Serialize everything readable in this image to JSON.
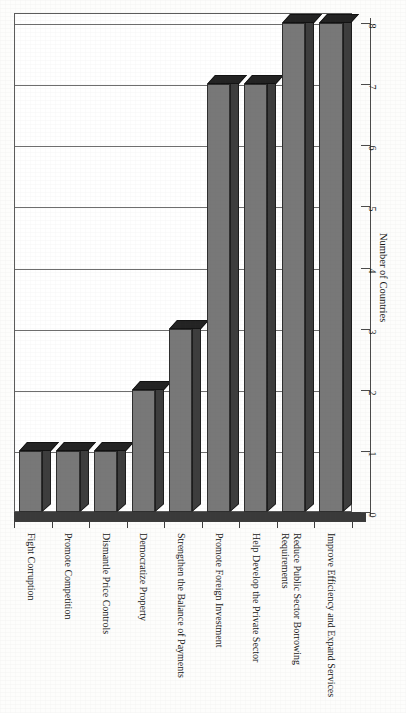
{
  "chart_data": {
    "type": "bar",
    "title": "",
    "subtitle": "",
    "orientation": "vertical-bars-rotated-page",
    "xlabel": "",
    "ylabel": "Number of Countries",
    "ylim": [
      0,
      8
    ],
    "ytick_labels": [
      "0",
      "1",
      "2",
      "3",
      "4",
      "5",
      "6",
      "7",
      "8"
    ],
    "ytick_values": [
      0,
      1,
      2,
      3,
      4,
      5,
      6,
      7,
      8
    ],
    "grid": "horizontal-gridlines-on",
    "legend": "none",
    "style_3d": true,
    "categories": [
      "Fight Corruption",
      "Promote Competition",
      "Dismantle Price Controls",
      "Democratize Property",
      "Strengthen the Balance of Payments",
      "Promote Foreign Investment",
      "Help Develop the Private Sector",
      "Reduce Public Sector Borrowing Requirements",
      "Improve Efficiency and Expand Services"
    ],
    "category_label_lines": [
      [
        "Fight Corruption"
      ],
      [
        "Promote Competition"
      ],
      [
        "Dismantle Price Controls"
      ],
      [
        "Democratize Property"
      ],
      [
        "Strengthen the Balance of Payments"
      ],
      [
        "Promote Foreign Investment"
      ],
      [
        "Help Develop the Private Sector"
      ],
      [
        "Reduce Public Sector Borrowing",
        "Requirements"
      ],
      [
        "Improve Efficiency and Expand Services"
      ]
    ],
    "values": [
      1,
      1,
      1,
      2,
      3,
      7,
      7,
      8,
      8
    ],
    "colors": {
      "bar_front": "#787878",
      "bar_top": "#232323",
      "bar_side": "#3d3d3d",
      "plot_background": "#ffffff",
      "gridline": "#6e6e6e",
      "axis": "#4a4a4a",
      "text": "#151515"
    }
  },
  "page": {
    "bleed_through_note": ""
  }
}
